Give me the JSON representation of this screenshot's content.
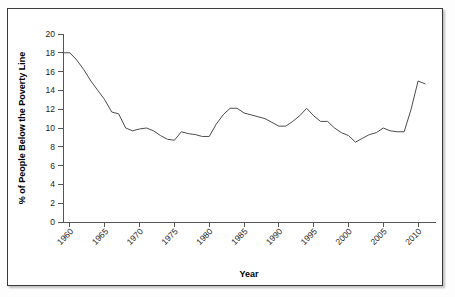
{
  "chart_data": {
    "type": "line",
    "title": "",
    "xlabel": "Year",
    "ylabel": "% of People Below the Poverty Line",
    "xlim": [
      1959,
      2012
    ],
    "ylim": [
      0,
      20
    ],
    "grid": false,
    "legend": null,
    "xticks": [
      1960,
      1965,
      1970,
      1975,
      1980,
      1985,
      1990,
      1995,
      2000,
      2005,
      2010
    ],
    "xtick_labels": [
      "1960",
      "1965",
      "1970",
      "1975",
      "1980",
      "1985",
      "1990",
      "1995",
      "2000",
      "2005",
      "2010"
    ],
    "yticks": [
      0,
      2,
      4,
      6,
      8,
      10,
      12,
      14,
      16,
      18,
      20
    ],
    "ytick_labels": [
      "0",
      "2",
      "4",
      "6",
      "8",
      "10",
      "12",
      "14",
      "16",
      "18",
      "20"
    ],
    "series": [
      {
        "name": "% of People Below the Poverty Line",
        "color": "#4d4d4d",
        "x": [
          1959,
          1960,
          1961,
          1962,
          1963,
          1964,
          1965,
          1966,
          1967,
          1968,
          1969,
          1970,
          1971,
          1972,
          1973,
          1974,
          1975,
          1976,
          1977,
          1978,
          1979,
          1980,
          1981,
          1982,
          1983,
          1984,
          1985,
          1986,
          1987,
          1988,
          1989,
          1990,
          1991,
          1992,
          1993,
          1994,
          1995,
          1996,
          1997,
          1998,
          1999,
          2000,
          2001,
          2002,
          2003,
          2004,
          2005,
          2006,
          2007,
          2008,
          2009,
          2010,
          2011
        ],
        "values": [
          18.0,
          18.0,
          17.2,
          16.2,
          15.0,
          14.0,
          13.0,
          11.7,
          11.5,
          10.0,
          9.7,
          9.9,
          10.0,
          9.7,
          9.2,
          8.8,
          8.7,
          9.6,
          9.4,
          9.3,
          9.1,
          9.1,
          10.4,
          11.4,
          12.1,
          12.1,
          11.6,
          11.4,
          11.2,
          11.0,
          10.6,
          10.2,
          10.2,
          10.7,
          11.3,
          12.1,
          11.3,
          10.7,
          10.7,
          10.0,
          9.5,
          9.2,
          8.5,
          8.9,
          9.3,
          9.5,
          10.0,
          9.7,
          9.6,
          9.6,
          12.0,
          15.0,
          14.7
        ]
      }
    ]
  },
  "figure": {
    "border_color": "#3a3a3a",
    "plot_line_color": "#4d4d4d",
    "axis_color": "#555555",
    "background": "#ffffff"
  }
}
